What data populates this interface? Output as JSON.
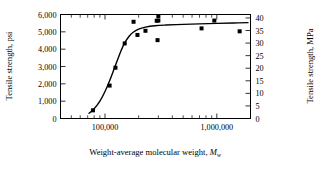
{
  "chart_data": {
    "type": "scatter",
    "title": "",
    "xlabel": "Weight-average molecular weight, Mw",
    "xlabel_main": "Weight-average molecular weight, ",
    "xlabel_symbol": "M",
    "xlabel_subscript": "w",
    "ylabel_left": "Tensile strength, psi",
    "ylabel_right": "Tensile strength, MPa",
    "xscale": "log",
    "xlim": [
      40000,
      2000000
    ],
    "ylim_left": [
      0,
      6000
    ],
    "ylim_right": [
      0,
      41.37
    ],
    "grid": false,
    "legend": false,
    "x_tick_labels": [
      "100,000",
      "1,000,000"
    ],
    "x_tick_values": [
      100000,
      1000000
    ],
    "y_left_tick_labels": [
      "0",
      "1,000",
      "2,000",
      "3,000",
      "4,000",
      "5,000",
      "6,000"
    ],
    "y_left_tick_values": [
      0,
      1000,
      2000,
      3000,
      4000,
      5000,
      6000
    ],
    "y_right_tick_labels": [
      "0",
      "5",
      "10",
      "15",
      "20",
      "25",
      "30",
      "35",
      "40"
    ],
    "y_right_tick_values": [
      0,
      5,
      10,
      15,
      20,
      25,
      30,
      35,
      40
    ],
    "points": [
      {
        "x": 78000,
        "y": 470
      },
      {
        "x": 110000,
        "y": 1900
      },
      {
        "x": 124000,
        "y": 2930
      },
      {
        "x": 150000,
        "y": 4330
      },
      {
        "x": 180000,
        "y": 5580
      },
      {
        "x": 195000,
        "y": 4820
      },
      {
        "x": 230000,
        "y": 5060
      },
      {
        "x": 290000,
        "y": 5640
      },
      {
        "x": 300000,
        "y": 5900
      },
      {
        "x": 300000,
        "y": 5650
      },
      {
        "x": 295000,
        "y": 4520
      },
      {
        "x": 730000,
        "y": 5200
      },
      {
        "x": 950000,
        "y": 5650
      },
      {
        "x": 1600000,
        "y": 5030
      }
    ],
    "curve": [
      {
        "x": 72000,
        "y": 300
      },
      {
        "x": 80000,
        "y": 560
      },
      {
        "x": 90000,
        "y": 1000
      },
      {
        "x": 100000,
        "y": 1560
      },
      {
        "x": 110000,
        "y": 2180
      },
      {
        "x": 120000,
        "y": 2820
      },
      {
        "x": 130000,
        "y": 3420
      },
      {
        "x": 140000,
        "y": 3950
      },
      {
        "x": 150000,
        "y": 4360
      },
      {
        "x": 165000,
        "y": 4760
      },
      {
        "x": 180000,
        "y": 4990
      },
      {
        "x": 200000,
        "y": 5160
      },
      {
        "x": 230000,
        "y": 5270
      },
      {
        "x": 280000,
        "y": 5350
      },
      {
        "x": 350000,
        "y": 5390
      },
      {
        "x": 500000,
        "y": 5430
      },
      {
        "x": 700000,
        "y": 5460
      },
      {
        "x": 1000000,
        "y": 5490
      },
      {
        "x": 1400000,
        "y": 5510
      },
      {
        "x": 1900000,
        "y": 5530
      }
    ],
    "marker_style": "filled-square",
    "marker_color": "#000000",
    "curve_color": "#000000"
  }
}
